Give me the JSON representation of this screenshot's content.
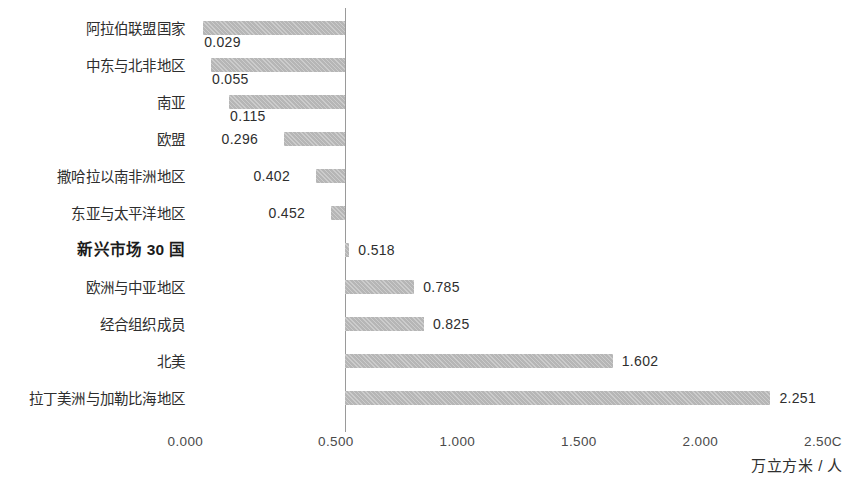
{
  "chart_data": {
    "type": "bar",
    "orientation": "horizontal",
    "title": "",
    "subtitle": "",
    "xlabel": "万立方米 / 人",
    "ylabel": "",
    "xlim": [
      0.0,
      2.5
    ],
    "grid": false,
    "legend": null,
    "axis_rule_at": 0.5,
    "bar_color": "#b6b6b6",
    "categories": [
      "阿拉伯联盟国家",
      "中东与北非地区",
      "南亚",
      "欧盟",
      "撒哈拉以南非洲地区",
      "东亚与太平洋地区",
      "新兴市场 30 国",
      "欧洲与中亚地区",
      "经合组织成员",
      "北美",
      "拉丁美洲与加勒比海地区"
    ],
    "values": [
      0.029,
      0.055,
      0.115,
      0.296,
      0.402,
      0.452,
      0.518,
      0.785,
      0.825,
      1.602,
      2.251
    ],
    "value_labels": [
      "0.029",
      "0.055",
      "0.115",
      "0.296",
      "0.402",
      "0.452",
      "0.518",
      "0.785",
      "0.825",
      "1.602",
      "2.251"
    ],
    "highlight_index": 6,
    "xticks": [
      0.0,
      0.5,
      1.0,
      1.5,
      2.0,
      2.5
    ],
    "xtick_labels": [
      "0.000",
      "0.500",
      "1.000",
      "1.500",
      "2.000",
      "2.50C"
    ]
  },
  "rows": [
    {
      "category": "阿拉伯联盟国家",
      "value": "0.029",
      "highlight": false
    },
    {
      "category": "中东与北非地区",
      "value": "0.055",
      "highlight": false
    },
    {
      "category": "南亚",
      "value": "0.115",
      "highlight": false
    },
    {
      "category": "欧盟",
      "value": "0.296",
      "highlight": false
    },
    {
      "category": "撒哈拉以南非洲地区",
      "value": "0.402",
      "highlight": false
    },
    {
      "category": "东亚与太平洋地区",
      "value": "0.452",
      "highlight": false
    },
    {
      "category": "新兴市场 30 国",
      "value": "0.518",
      "highlight": true
    },
    {
      "category": "欧洲与中亚地区",
      "value": "0.785",
      "highlight": false
    },
    {
      "category": "经合组织成员",
      "value": "0.825",
      "highlight": false
    },
    {
      "category": "北美",
      "value": "1.602",
      "highlight": false
    },
    {
      "category": "拉丁美洲与加勒比海地区",
      "value": "2.251",
      "highlight": false
    }
  ],
  "axis": {
    "ticks": [
      "0.000",
      "0.500",
      "1.000",
      "1.500",
      "2.000",
      "2.50C"
    ],
    "unit": "万立方米 / 人"
  }
}
